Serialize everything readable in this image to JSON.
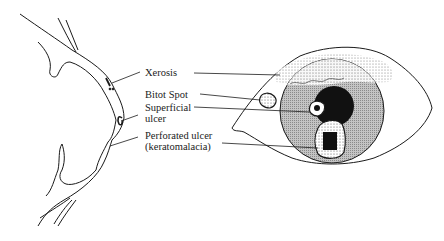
{
  "figure": {
    "labels": [
      {
        "id": "xerosis",
        "lines": [
          "Xerosis"
        ]
      },
      {
        "id": "bitot-spot",
        "lines": [
          "Bitot Spot"
        ]
      },
      {
        "id": "superficial-ulcer",
        "lines": [
          "Superficial",
          "ulcer"
        ]
      },
      {
        "id": "perforated-ulcer",
        "lines": [
          "Perforated ulcer",
          "(keratomalacia)"
        ]
      }
    ]
  },
  "colors": {
    "ink": "#1a1a1a",
    "iris_gray": "#b8b8b8",
    "speckle": "#e6e6e6",
    "background": "#ffffff"
  }
}
